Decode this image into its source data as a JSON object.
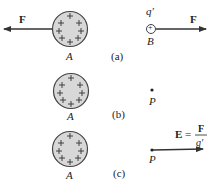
{
  "panels": [
    {
      "id": "a",
      "label": "(a)",
      "sphere_label": "A",
      "left_force_label": "F",
      "test_charge_label": "q′",
      "test_charge_sign": "+",
      "point_label": "B",
      "right_force_label": "F"
    },
    {
      "id": "b",
      "label": "(b)",
      "sphere_label": "A",
      "point_label": "P"
    },
    {
      "id": "c",
      "label": "(c)",
      "sphere_label": "A",
      "point_label": "P",
      "field_lhs": "E",
      "equals": "=",
      "field_numerator": "F",
      "field_denominator": "q′"
    }
  ],
  "colors": {
    "sphere_fill": "#d8d8d8",
    "sphere_stroke": "#444444",
    "arrow": "#333333",
    "text": "#222222"
  }
}
